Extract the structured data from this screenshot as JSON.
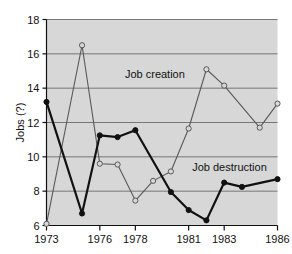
{
  "chart_data": {
    "type": "line",
    "title": "",
    "xlabel": "",
    "ylabel": "Jobs (?)",
    "xlim": [
      1973,
      1986
    ],
    "ylim": [
      6,
      18
    ],
    "grid": true,
    "legend_position": "inline-annotations",
    "x": [
      1973,
      1974,
      1975,
      1976,
      1977,
      1978,
      1979,
      1980,
      1981,
      1982,
      1983,
      1984,
      1985,
      1986
    ],
    "xtick_labels": [
      "1973",
      "1976",
      "1978",
      "1981",
      "1983",
      "1986"
    ],
    "xtick_values": [
      1973,
      1976,
      1978,
      1981,
      1983,
      1986
    ],
    "ytick_labels": [
      "6",
      "8",
      "10",
      "12",
      "14",
      "16",
      "18"
    ],
    "ytick_values": [
      6,
      8,
      10,
      12,
      14,
      16,
      18
    ],
    "series": [
      {
        "name": "Job creation",
        "marker": "open-circle",
        "x": [
          1973,
          1975,
          1976,
          1977,
          1978,
          1979,
          1980,
          1981,
          1982,
          1983,
          1985,
          1986
        ],
        "values": [
          6.1,
          16.5,
          9.6,
          9.55,
          7.45,
          8.6,
          9.15,
          11.65,
          15.1,
          14.15,
          11.7,
          13.1
        ]
      },
      {
        "name": "Job destruction",
        "marker": "filled-circle",
        "x": [
          1973,
          1975,
          1976,
          1977,
          1978,
          1980,
          1981,
          1982,
          1983,
          1984,
          1986
        ],
        "values": [
          13.2,
          6.7,
          11.25,
          11.15,
          11.55,
          7.95,
          6.9,
          6.3,
          8.5,
          8.25,
          8.7
        ]
      }
    ],
    "annotations": [
      {
        "text": "Job creation",
        "x": 1979.1,
        "y": 14.6
      },
      {
        "text": "Job destruction",
        "x": 1983.3,
        "y": 9.15
      }
    ],
    "colors": {
      "plot_background": "#d7d7d7",
      "gridline": "#6b6b6b",
      "job_creation_line": "#585858",
      "job_destruction_line": "#111111",
      "axis": "#111111",
      "text": "#111111",
      "marker_fill_open": "#d7d7d7"
    }
  }
}
